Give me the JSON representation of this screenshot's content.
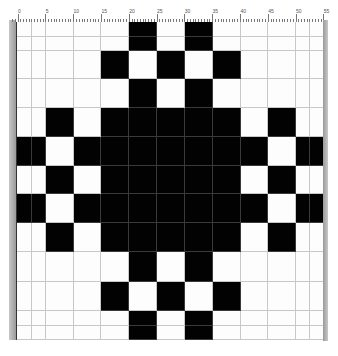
{
  "ruler": {
    "labels": [
      "0",
      "5",
      "10",
      "15",
      "20",
      "25",
      "30",
      "35",
      "40",
      "45",
      "50",
      "55"
    ]
  },
  "grid": {
    "col_edges": [
      16,
      31,
      45,
      73,
      100,
      128,
      156,
      184,
      212,
      240,
      267,
      295,
      309,
      323
    ],
    "row_edges": [
      22,
      37,
      51,
      79,
      108,
      137,
      166,
      194,
      223,
      252,
      282,
      311,
      326,
      340
    ],
    "colors": {
      "filled": "#020202",
      "empty": "#fdfdfd",
      "gridline": "#c8c8c8"
    },
    "pattern": [
      "0000010100000",
      "0000010100000",
      "0000101010000",
      "0000010100000",
      "0010111110100",
      "1101111111011",
      "0010111110100",
      "1101111111011",
      "0010111110100",
      "0000010100000",
      "0000101010000",
      "0000010100000",
      "0000010100000"
    ]
  }
}
